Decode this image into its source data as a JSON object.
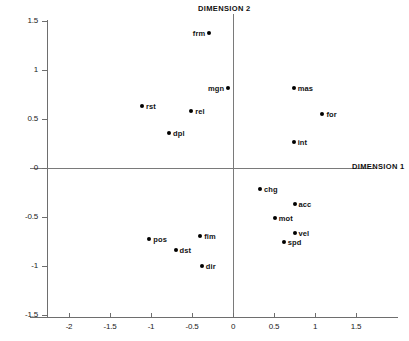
{
  "chart_data": {
    "type": "scatter",
    "title": "",
    "xlabel": "DIMENSION 1",
    "ylabel": "DIMENSION 2",
    "xlim": [
      -2.4,
      1.9
    ],
    "ylim": [
      -1.5,
      1.5
    ],
    "grid": false,
    "legend": null,
    "xticks": [
      -2,
      -1.5,
      -1,
      -0.5,
      0,
      0.5,
      1,
      1.5
    ],
    "xtick_labels": [
      "-2",
      "-1.5",
      "-1",
      "-0.5",
      "0",
      "0.5",
      "1",
      "1.5"
    ],
    "yticks": [
      1.5,
      1,
      0.5,
      0,
      -0.5,
      -1,
      -1.5
    ],
    "ytick_labels": [
      "1.5",
      "1",
      "0.5",
      "0",
      "-0.5",
      "-1",
      "-1.5"
    ],
    "points": [
      {
        "label": "frm",
        "x": -0.29,
        "y": 1.38,
        "label_pos": "left"
      },
      {
        "label": "mgn",
        "x": -0.06,
        "y": 0.82,
        "label_pos": "left"
      },
      {
        "label": "mas",
        "x": 0.74,
        "y": 0.82,
        "label_pos": "right"
      },
      {
        "label": "rst",
        "x": -1.11,
        "y": 0.63,
        "label_pos": "right"
      },
      {
        "label": "rel",
        "x": -0.51,
        "y": 0.58,
        "label_pos": "right"
      },
      {
        "label": "for",
        "x": 1.09,
        "y": 0.55,
        "label_pos": "right"
      },
      {
        "label": "dpl",
        "x": -0.78,
        "y": 0.36,
        "label_pos": "right"
      },
      {
        "label": "int",
        "x": 0.74,
        "y": 0.27,
        "label_pos": "right"
      },
      {
        "label": "chg",
        "x": 0.33,
        "y": -0.21,
        "label_pos": "right"
      },
      {
        "label": "acc",
        "x": 0.75,
        "y": -0.37,
        "label_pos": "right"
      },
      {
        "label": "mot",
        "x": 0.51,
        "y": -0.51,
        "label_pos": "right"
      },
      {
        "label": "vel",
        "x": 0.75,
        "y": -0.66,
        "label_pos": "right"
      },
      {
        "label": "fim",
        "x": -0.4,
        "y": -0.69,
        "label_pos": "right"
      },
      {
        "label": "pos",
        "x": -1.02,
        "y": -0.72,
        "label_pos": "right"
      },
      {
        "label": "spd",
        "x": 0.62,
        "y": -0.75,
        "label_pos": "right"
      },
      {
        "label": "dst",
        "x": -0.7,
        "y": -0.84,
        "label_pos": "right"
      },
      {
        "label": "dir",
        "x": -0.38,
        "y": -1.0,
        "label_pos": "right"
      }
    ],
    "colors": {
      "marker": "#000000",
      "axis": "#7a7a7a",
      "text": "#111111",
      "background": "#ffffff"
    }
  }
}
